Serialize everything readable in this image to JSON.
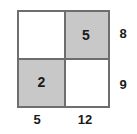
{
  "diagram": {
    "type": "area-model-2x2-grid",
    "colors": {
      "shaded_fill": "#c8c8c8",
      "unshaded_fill": "#ffffff",
      "border": "#6e6e6e",
      "text": "#1a1a1a",
      "background": "#ffffff"
    },
    "cells": [
      {
        "position": "top-left",
        "label": "",
        "shaded": false
      },
      {
        "position": "top-right",
        "label": "5",
        "shaded": true
      },
      {
        "position": "bottom-left",
        "label": "2",
        "shaded": true
      },
      {
        "position": "bottom-right",
        "label": "",
        "shaded": false
      }
    ],
    "row_labels": [
      {
        "row": "top",
        "value": "8"
      },
      {
        "row": "bottom",
        "value": "9"
      }
    ],
    "column_labels": [
      {
        "column": "left",
        "value": "5"
      },
      {
        "column": "right",
        "value": "12"
      }
    ]
  },
  "chart_data": {
    "type": "table",
    "title": "",
    "xlabel": "",
    "ylabel": "",
    "columns": [
      "5",
      "12"
    ],
    "rows": [
      "8",
      "9"
    ],
    "values": [
      [
        "",
        "5"
      ],
      [
        "2",
        ""
      ]
    ],
    "shaded": [
      [
        false,
        true
      ],
      [
        true,
        false
      ]
    ],
    "legend": [],
    "grid": true
  }
}
